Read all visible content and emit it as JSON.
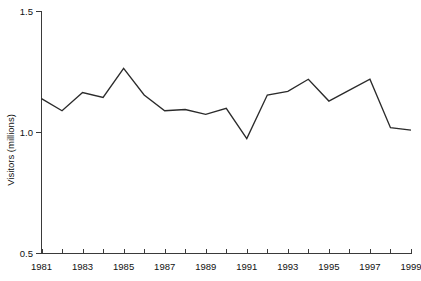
{
  "chart_data": {
    "type": "line",
    "title": "",
    "subtitle": "",
    "xlabel": "",
    "ylabel": "Visitors (millions)",
    "x": [
      1981,
      1982,
      1983,
      1984,
      1985,
      1986,
      1987,
      1988,
      1989,
      1990,
      1991,
      1992,
      1993,
      1994,
      1995,
      1996,
      1997,
      1998,
      1999
    ],
    "values": [
      1.14,
      1.09,
      1.165,
      1.145,
      1.265,
      1.155,
      1.09,
      1.095,
      1.075,
      1.1,
      0.975,
      1.155,
      1.17,
      1.22,
      1.13,
      1.175,
      1.22,
      1.02,
      1.01
    ],
    "series": [
      {
        "name": "Visitors",
        "values": [
          1.14,
          1.09,
          1.165,
          1.145,
          1.265,
          1.155,
          1.09,
          1.095,
          1.075,
          1.1,
          0.975,
          1.155,
          1.17,
          1.22,
          1.13,
          1.175,
          1.22,
          1.02,
          1.01
        ]
      }
    ],
    "xlim": [
      1981,
      1999
    ],
    "ylim": [
      0.5,
      1.5
    ],
    "y_ticks": [
      0.5,
      1.0,
      1.5
    ],
    "y_tick_labels": [
      "0.5",
      "1.0",
      "1.5"
    ],
    "x_ticks": [
      1981,
      1982,
      1983,
      1984,
      1985,
      1986,
      1987,
      1988,
      1989,
      1990,
      1991,
      1992,
      1993,
      1994,
      1995,
      1996,
      1997,
      1998,
      1999
    ],
    "x_tick_labels_shown": [
      "1981",
      "1983",
      "1985",
      "1987",
      "1989",
      "1991",
      "1993",
      "1995",
      "1997",
      "1999"
    ],
    "x_labeled_years": [
      1981,
      1983,
      1985,
      1987,
      1989,
      1991,
      1993,
      1995,
      1997,
      1999
    ],
    "grid": false,
    "legend": false,
    "legend_position": "none",
    "line_color": "#2b2b2b",
    "axis_color": "#3a3a3a",
    "background_color": "#ffffff",
    "annotations": []
  }
}
